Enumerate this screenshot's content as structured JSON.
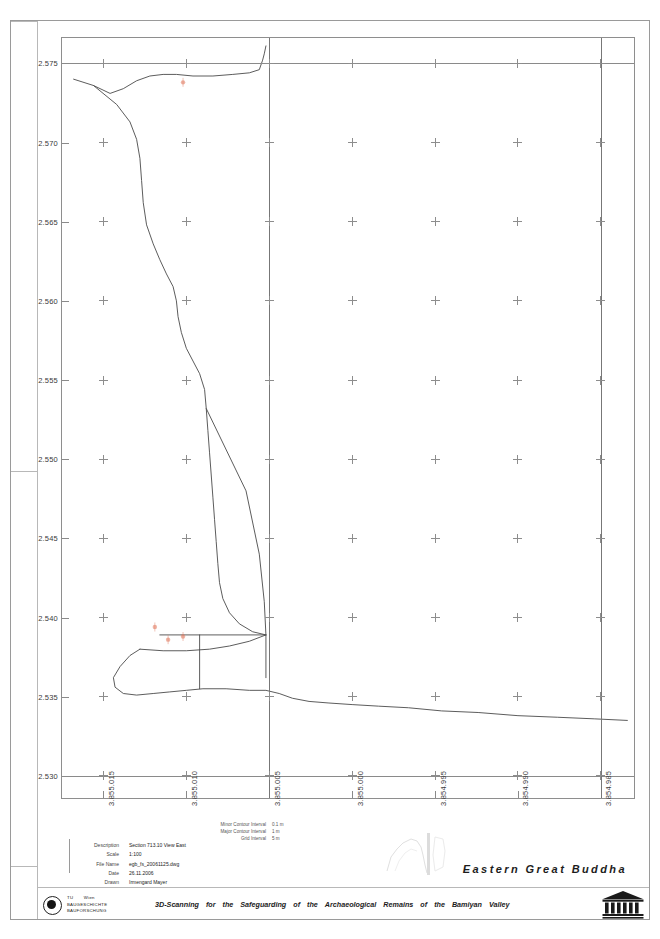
{
  "sheet": {
    "title": "Eastern Great Buddha",
    "footer_words": [
      "3D-Scanning",
      "for",
      "the",
      "Safeguarding",
      "of",
      "the",
      "Archaeological",
      "Remains",
      "of",
      "the",
      "Bamiyan",
      "Valley"
    ]
  },
  "titleblock": {
    "rows": [
      {
        "label": "Description",
        "value": "Section 713.10 View East"
      },
      {
        "label": "Scale",
        "value": "1:100"
      },
      {
        "label": "File Name",
        "value": "egb_fs_20061125.dwg"
      },
      {
        "label": "Date",
        "value": "26.11.2006"
      },
      {
        "label": "Drawn",
        "value": "Irmengard Mayer"
      }
    ]
  },
  "contour_legend": {
    "rows": [
      {
        "label": "Minor Contour Interval",
        "value": "0.1 m"
      },
      {
        "label": "Major Contour Interval",
        "value": "1 m"
      },
      {
        "label": "Grid Interval",
        "value": "5 m"
      }
    ]
  },
  "logos": {
    "tu": {
      "line1": "TU",
      "line2": "Wien",
      "line3": "BAUGESCHICHTE",
      "line4": "BAUFORSCHUNG",
      "icon": "eye-icon"
    },
    "unesco": {
      "label": "UNESCO",
      "icon": "unesco-temple-icon"
    }
  },
  "chart_data": {
    "type": "line",
    "title": "Section 713.10 View East",
    "xlabel": "",
    "ylabel": "",
    "grid": "crosses",
    "legend": "none",
    "x_ticks": [
      "3.855.015",
      "3.855.010",
      "3.855.005",
      "3.855.000",
      "3.854.995",
      "3.854.990",
      "3.854.985"
    ],
    "x_values": [
      3855015,
      3855010,
      3855005,
      3855000,
      3854995,
      3854990,
      3854985
    ],
    "xlim": [
      3855017.5,
      3854983.0
    ],
    "y_ticks": [
      "2.575",
      "2.570",
      "2.565",
      "2.560",
      "2.555",
      "2.550",
      "2.545",
      "2.540",
      "2.535",
      "2.530"
    ],
    "y_values": [
      2575,
      2570,
      2565,
      2560,
      2555,
      2550,
      2545,
      2540,
      2535,
      2530
    ],
    "ylim": [
      2528.6,
      2576.6
    ],
    "series": [
      {
        "name": "rock-face-profile",
        "color": "#4a4a4a",
        "points": [
          [
            3855016.8,
            2574.0
          ],
          [
            3855015.6,
            2573.6
          ],
          [
            3855014.6,
            2573.1
          ],
          [
            3855013.8,
            2573.4
          ],
          [
            3855013.0,
            2573.9
          ],
          [
            3855012.2,
            2574.2
          ],
          [
            3855011.4,
            2574.3
          ],
          [
            3855010.6,
            2574.3
          ],
          [
            3855009.6,
            2574.2
          ],
          [
            3855008.4,
            2574.2
          ],
          [
            3855007.2,
            2574.3
          ],
          [
            3855006.2,
            2574.4
          ],
          [
            3855005.6,
            2574.6
          ],
          [
            3855005.4,
            2575.2
          ],
          [
            3855005.3,
            2575.6
          ],
          [
            3855005.2,
            2576.1
          ]
        ]
      },
      {
        "name": "west-cliff-edge",
        "color": "#4a4a4a",
        "points": [
          [
            3855015.6,
            2573.6
          ],
          [
            3855014.2,
            2572.4
          ],
          [
            3855013.4,
            2571.3
          ],
          [
            3855013.0,
            2570.2
          ],
          [
            3855012.8,
            2569.0
          ],
          [
            3855012.7,
            2567.6
          ],
          [
            3855012.6,
            2566.2
          ],
          [
            3855012.4,
            2564.8
          ],
          [
            3855012.0,
            2563.6
          ],
          [
            3855011.6,
            2562.6
          ],
          [
            3855011.2,
            2561.7
          ],
          [
            3855010.8,
            2560.9
          ],
          [
            3855010.6,
            2560.0
          ],
          [
            3855010.5,
            2559.0
          ],
          [
            3855010.3,
            2558.0
          ],
          [
            3855010.0,
            2557.0
          ],
          [
            3855009.6,
            2556.2
          ],
          [
            3855009.2,
            2555.4
          ],
          [
            3855008.9,
            2554.4
          ],
          [
            3855008.8,
            2553.2
          ],
          [
            3855008.7,
            2551.8
          ],
          [
            3855008.6,
            2550.4
          ],
          [
            3855008.5,
            2549.0
          ],
          [
            3855008.4,
            2547.6
          ],
          [
            3855008.3,
            2546.2
          ],
          [
            3855008.2,
            2544.8
          ],
          [
            3855008.1,
            2543.4
          ],
          [
            3855008.0,
            2542.2
          ],
          [
            3855007.8,
            2541.2
          ],
          [
            3855007.4,
            2540.3
          ],
          [
            3855006.8,
            2539.6
          ],
          [
            3855006.0,
            2539.1
          ],
          [
            3855005.2,
            2538.9
          ]
        ]
      },
      {
        "name": "niche-back-wall",
        "color": "#4a4a4a",
        "points": [
          [
            3855008.8,
            2553.2
          ],
          [
            3855006.4,
            2548.0
          ],
          [
            3855005.6,
            2544.0
          ],
          [
            3855005.3,
            2541.0
          ],
          [
            3855005.2,
            2538.9
          ],
          [
            3855005.2,
            2536.2
          ]
        ]
      },
      {
        "name": "niche-floor-upper",
        "color": "#4a4a4a",
        "points": [
          [
            3855011.6,
            2538.9
          ],
          [
            3855005.2,
            2538.9
          ]
        ]
      },
      {
        "name": "niche-floor-step",
        "color": "#4a4a4a",
        "points": [
          [
            3855009.2,
            2538.9
          ],
          [
            3855009.2,
            2535.5
          ]
        ]
      },
      {
        "name": "valley-floor-profile",
        "color": "#4a4a4a",
        "points": [
          [
            3855012.8,
            2538.0
          ],
          [
            3855013.4,
            2537.6
          ],
          [
            3855014.0,
            2536.9
          ],
          [
            3855014.4,
            2536.2
          ],
          [
            3855014.3,
            2535.6
          ],
          [
            3855013.8,
            2535.2
          ],
          [
            3855013.0,
            2535.1
          ],
          [
            3855012.0,
            2535.2
          ],
          [
            3855011.0,
            2535.3
          ],
          [
            3855010.0,
            2535.4
          ],
          [
            3855009.0,
            2535.5
          ],
          [
            3855007.6,
            2535.5
          ],
          [
            3855006.2,
            2535.4
          ],
          [
            3855005.2,
            2535.4
          ],
          [
            3855004.4,
            2535.2
          ],
          [
            3855003.6,
            2534.9
          ],
          [
            3855002.6,
            2534.7
          ],
          [
            3855001.4,
            2534.6
          ],
          [
            3855000.0,
            2534.5
          ],
          [
            3854998.4,
            2534.4
          ],
          [
            3854996.6,
            2534.3
          ],
          [
            3854994.6,
            2534.1
          ],
          [
            3854992.4,
            2534.0
          ],
          [
            3854990.0,
            2533.8
          ],
          [
            3854987.6,
            2533.7
          ],
          [
            3854985.4,
            2533.6
          ],
          [
            3854983.4,
            2533.5
          ]
        ]
      },
      {
        "name": "lower-west-slope",
        "color": "#4a4a4a",
        "points": [
          [
            3855005.2,
            2538.9
          ],
          [
            3855006.2,
            2538.5
          ],
          [
            3855007.4,
            2538.2
          ],
          [
            3855008.6,
            2538.0
          ],
          [
            3855010.0,
            2537.9
          ],
          [
            3855011.4,
            2537.9
          ],
          [
            3855012.8,
            2538.0
          ]
        ]
      }
    ],
    "annotations": [
      {
        "name": "survey-mark-top",
        "x": 3855010.2,
        "y": 2573.8,
        "color": "#e0755a",
        "label": ""
      },
      {
        "name": "survey-mark-lower-a",
        "x": 3855011.9,
        "y": 2539.4,
        "color": "#e0755a",
        "label": ""
      },
      {
        "name": "survey-mark-lower-b",
        "x": 3855011.1,
        "y": 2538.6,
        "color": "#e0755a",
        "label": ""
      },
      {
        "name": "survey-mark-lower-c",
        "x": 3855010.2,
        "y": 2538.8,
        "color": "#e0755a",
        "label": ""
      }
    ]
  }
}
